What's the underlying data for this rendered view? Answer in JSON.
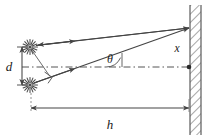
{
  "figure": {
    "type": "physics-ray-diagram",
    "background_color": "#ffffff",
    "line_color": "#444444",
    "label_color": "#1a1a1a",
    "hatch_color": "#8a8a8a"
  },
  "labels": {
    "separation": "d",
    "angle": "θ",
    "screen_offset": "x",
    "distance": "h"
  },
  "elements": {
    "source_upper_name": "light-source-upper",
    "source_lower_name": "light-source-lower",
    "ray_upper_name": "ray-upper",
    "ray_lower_name": "ray-lower",
    "wall_name": "screen-wall",
    "centerline_name": "optical-axis-dashed",
    "right_angle_name": "right-angle-marker",
    "angle_arc_name": "angle-arc",
    "convergence_name": "convergence-point",
    "axis_point_name": "axis-screen-point"
  },
  "geometry": {
    "source_upper": {
      "x": 30,
      "y": 47
    },
    "source_lower": {
      "x": 30,
      "y": 85
    },
    "convergence": {
      "x": 189,
      "y": 28
    },
    "axis_screen": {
      "x": 189,
      "y": 67
    },
    "axis_start": {
      "x": 22,
      "y": 67
    },
    "wall_x": 190,
    "wall_width": 11,
    "wall_top": 5,
    "wall_bottom": 135,
    "d_dim_x": 22,
    "d_dim_top": 47,
    "d_dim_bottom": 85,
    "h_dim_y": 108,
    "h_dim_left": 31,
    "h_dim_right": 189,
    "angle_vertex": {
      "x": 122,
      "y": 67
    },
    "theta_label": {
      "x": 110,
      "y": 63
    },
    "d_label": {
      "x": 9,
      "y": 70
    },
    "h_label": {
      "x": 110,
      "y": 128
    },
    "x_label": {
      "x": 176,
      "y": 50
    }
  }
}
